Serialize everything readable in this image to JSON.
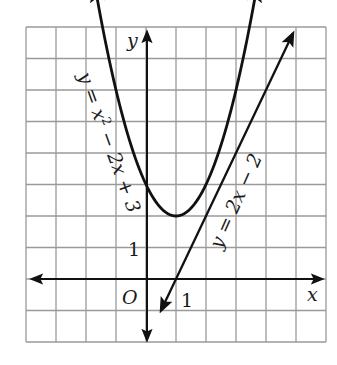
{
  "chart_data": {
    "type": "line",
    "title": "",
    "xlabel": "x",
    "ylabel": "y",
    "xlim": [
      -4,
      6
    ],
    "ylim": [
      -2,
      8
    ],
    "grid": true,
    "origin_label": "O",
    "x_tick_labels": [
      {
        "value": 1,
        "label": "1"
      }
    ],
    "y_tick_labels": [
      {
        "value": 1,
        "label": "1"
      }
    ],
    "series": [
      {
        "name": "y = x² − 2x + 3",
        "equation": "y = x^2 - 2x + 3",
        "kind": "parabola",
        "vertex": [
          1,
          2
        ],
        "x": [
          -1.7,
          -1,
          0,
          1,
          2,
          3,
          3.7
        ],
        "values": [
          9.29,
          6,
          3,
          2,
          3,
          6,
          9.29
        ]
      },
      {
        "name": "y = 2x − 2",
        "equation": "y = 2x - 2",
        "kind": "line",
        "x": [
          0.5,
          1,
          2,
          3,
          4,
          4.9
        ],
        "values": [
          -1,
          0,
          2,
          4,
          6,
          7.8
        ]
      }
    ]
  },
  "labels": {
    "x_axis": "x",
    "y_axis": "y",
    "origin": "O",
    "x_tick_1": "1",
    "y_tick_1": "1",
    "parabola_label_pre": "y = x",
    "parabola_label_sup": "2",
    "parabola_label_post": " − 2x + 3",
    "line_label": "y = 2x − 2"
  },
  "colors": {
    "grid": "#9a9a9a",
    "axes": "#111111",
    "curves": "#111111",
    "background": "#ffffff"
  }
}
